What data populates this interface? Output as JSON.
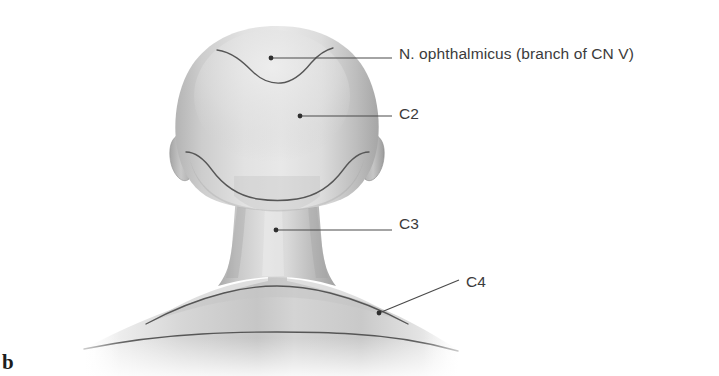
{
  "figure": {
    "letter": "b",
    "view": "posterior view of head, neck and shoulders"
  },
  "colors": {
    "background": "#ffffff",
    "text": "#3b3b3b",
    "figure_letter": "#1d1d1d",
    "leader_line": "#4a4a4a",
    "boundary_line": "#5a5a5a",
    "skin_light": "#e6e6e6",
    "skin_mid": "#d2d2d2",
    "skin_shadow": "#a8a8a8",
    "skin_deep_shadow": "#8e8e8e"
  },
  "labels": [
    {
      "id": "ophthalmicus",
      "text": "N. ophthalmicus (branch of CN V)",
      "leader": {
        "type": "horizontal",
        "dot_x": 271,
        "dot_y": 58,
        "end_x": 392,
        "end_y": 58
      },
      "region": "vertex of scalp anterior to C2 boundary"
    },
    {
      "id": "c2",
      "text": "C2",
      "leader": {
        "type": "horizontal",
        "dot_x": 300,
        "dot_y": 116,
        "end_x": 392,
        "end_y": 116
      },
      "region": "occipital scalp"
    },
    {
      "id": "c3",
      "text": "C3",
      "leader": {
        "type": "horizontal",
        "dot_x": 276,
        "dot_y": 230,
        "end_x": 392,
        "end_y": 230
      },
      "region": "posterior neck"
    },
    {
      "id": "c4",
      "text": "C4",
      "leader": {
        "type": "diagonal",
        "dot_x": 379,
        "dot_y": 313,
        "end_x": 459,
        "end_y": 280
      },
      "region": "shoulder and upper back"
    }
  ],
  "dermatome_boundaries": [
    {
      "id": "ophthalmicus-c2-boundary",
      "description": "wavy line across vertex of scalp"
    },
    {
      "id": "c2-c3-boundary",
      "description": "U-shaped line from ear to ear across nape"
    },
    {
      "id": "c3-c4-boundary",
      "description": "gently curved line across base of neck and shoulders"
    },
    {
      "id": "c4-lower-boundary",
      "description": "line across upper back below shoulders"
    }
  ]
}
